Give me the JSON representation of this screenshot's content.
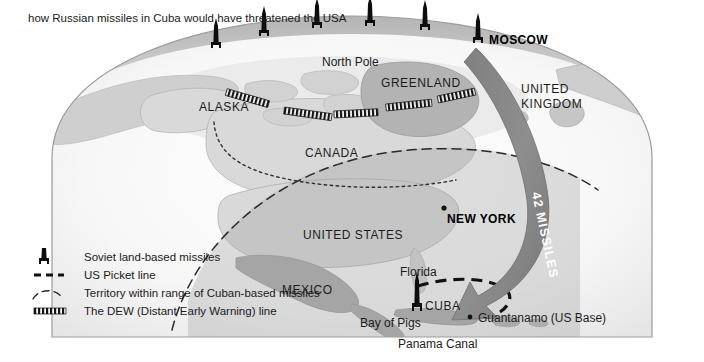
{
  "title": "how Russian missiles in Cuba would have threatened the USA",
  "colors": {
    "land": "#d9d9d9",
    "land_dark": "#a8a8a8",
    "ocean": "#f4f4f4",
    "globe_edge": "#9a9a9a",
    "arrow": "#8a8a8a",
    "border": "#9b9b9b",
    "ink": "#1a1a1a"
  },
  "arrow": {
    "label": "42 MISSILES",
    "from": "MOSCOW",
    "to": "CUBA"
  },
  "places": [
    {
      "name": "North Pole",
      "style": "place",
      "x": 322,
      "y": 55,
      "id": "north-pole"
    },
    {
      "name": "GREENLAND",
      "style": "place-caps",
      "x": 381,
      "y": 76,
      "id": "greenland"
    },
    {
      "name": "ALASKA",
      "style": "place-caps",
      "x": 199,
      "y": 100,
      "id": "alaska"
    },
    {
      "name": "CANADA",
      "style": "place-caps",
      "x": 305,
      "y": 146,
      "id": "canada"
    },
    {
      "name": "UNITED",
      "style": "place-caps",
      "x": 521,
      "y": 82,
      "id": "united-kingdom-1"
    },
    {
      "name": "KINGDOM",
      "style": "place-caps",
      "x": 521,
      "y": 97,
      "id": "united-kingdom-2"
    },
    {
      "name": "UNITED STATES",
      "style": "place-caps",
      "x": 303,
      "y": 228,
      "id": "united-states"
    },
    {
      "name": "MEXICO",
      "style": "place-caps",
      "x": 282,
      "y": 283,
      "id": "mexico"
    },
    {
      "name": "Florida",
      "style": "place",
      "x": 400,
      "y": 265,
      "id": "florida"
    },
    {
      "name": "CUBA",
      "style": "place-caps",
      "x": 425,
      "y": 305,
      "id": "cuba"
    },
    {
      "name": "Bay of Pigs",
      "style": "place",
      "x": 360,
      "y": 319,
      "id": "bay-of-pigs"
    },
    {
      "name": "Panama Canal",
      "style": "place",
      "x": 398,
      "y": 340,
      "id": "panama-canal"
    },
    {
      "name": "Guantanamo (US Base)",
      "style": "place",
      "x": 478,
      "y": 318,
      "id": "guantanamo"
    }
  ],
  "cities": [
    {
      "name": "MOSCOW",
      "x": 489,
      "y": 33,
      "id": "moscow"
    },
    {
      "name": "NEW YORK",
      "x": 447,
      "y": 218,
      "id": "new-york"
    }
  ],
  "missiles": [
    {
      "x": 216,
      "y": 48,
      "id": "missile-1"
    },
    {
      "x": 264,
      "y": 36,
      "id": "missile-2"
    },
    {
      "x": 317,
      "y": 28,
      "id": "missile-3"
    },
    {
      "x": 370,
      "y": 26,
      "id": "missile-4"
    },
    {
      "x": 425,
      "y": 30,
      "id": "missile-5"
    },
    {
      "x": 478,
      "y": 43,
      "id": "missile-6"
    }
  ],
  "legend": {
    "items": [
      {
        "icon": "missile-icon",
        "label": "Soviet land-based missiles"
      },
      {
        "icon": "dashed-line-icon",
        "label": "US Picket line"
      },
      {
        "icon": "arc-icon",
        "label": "Territory within range of Cuban-based missiles"
      },
      {
        "icon": "dew-line-icon",
        "label": "The DEW (Distant Early Warning) line"
      }
    ]
  },
  "dew_segments": [
    {
      "x1": 226,
      "y1": 93,
      "x2": 268,
      "y2": 106
    },
    {
      "x1": 284,
      "y1": 111,
      "x2": 330,
      "y2": 118
    },
    {
      "x1": 330,
      "y1": 115,
      "x2": 372,
      "y2": 113
    },
    {
      "x1": 381,
      "y1": 108,
      "x2": 428,
      "y2": 104
    },
    {
      "x1": 435,
      "y1": 100,
      "x2": 470,
      "y2": 94
    }
  ]
}
